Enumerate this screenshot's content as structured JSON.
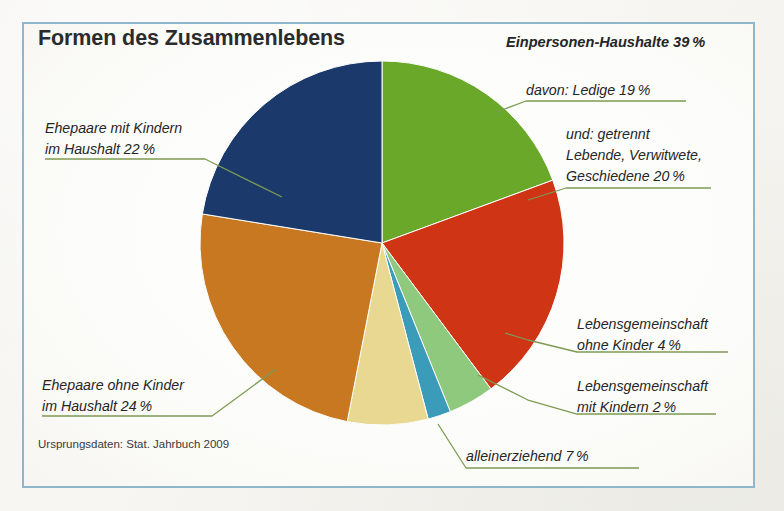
{
  "poster": {
    "title": "Formen des Zusammenlebens",
    "source": "Ursprungsdaten: Stat. Jahrbuch 2009",
    "frame_color": "#8fb7cc",
    "leader_color": "#7d9b52",
    "background": "#fdfdfb"
  },
  "labels": {
    "ehepaare_mit_kindern_l1": "Ehepaare mit Kindern",
    "ehepaare_mit_kindern_l2": "im Haushalt 22 %",
    "ehepaare_ohne_kinder_l1": "Ehepaare ohne Kinder",
    "ehepaare_ohne_kinder_l2": "im Haushalt 24 %",
    "einpersonen_haushalte": "Einpersonen-Haushalte 39 %",
    "davon_ledige": "davon: Ledige 19 %",
    "getrennt_l1": "und: getrennt",
    "getrennt_l2": "Lebende, Verwitwete,",
    "getrennt_l3": "Geschiedene 20 %",
    "lg_ohne_kinder_l1": "Lebensgemeinschaft",
    "lg_ohne_kinder_l2": "ohne Kinder 4 %",
    "lg_mit_kindern_l1": "Lebensgemeinschaft",
    "lg_mit_kindern_l2": "mit Kindern 2 %",
    "alleinerziehend": "alleinerziehend 7 %"
  },
  "chart_data": {
    "type": "pie",
    "title": "Formen des Zusammenlebens",
    "unit": "percent",
    "start_angle_deg": 0,
    "direction": "clockwise",
    "center": [
      382,
      243
    ],
    "radius": 182,
    "categories": [
      "davon: Ledige",
      "und: getrennt Lebende, Verwitwete, Geschiedene",
      "Lebensgemeinschaft ohne Kinder",
      "Lebensgemeinschaft mit Kindern",
      "alleinerziehend",
      "Ehepaare ohne Kinder im Haushalt",
      "Ehepaare mit Kindern im Haushalt"
    ],
    "values": [
      19,
      20,
      4,
      2,
      7,
      24,
      22
    ],
    "colors": [
      "#6aa82a",
      "#cf3515",
      "#8fc97e",
      "#3a9cb8",
      "#e8d891",
      "#c87820",
      "#1b3a6b"
    ],
    "groups": [
      {
        "name": "Einpersonen-Haushalte",
        "value": 39,
        "members": [
          "davon: Ledige",
          "und: getrennt Lebende, Verwitwete, Geschiedene"
        ]
      }
    ],
    "legend": "callout-labels",
    "grid": false
  }
}
